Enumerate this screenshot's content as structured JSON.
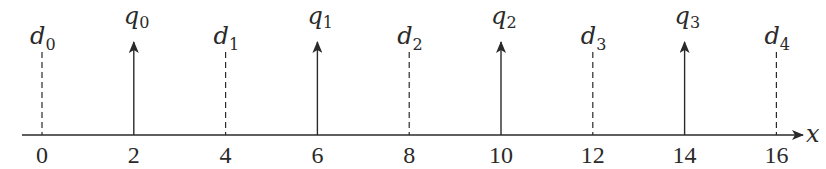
{
  "diagram": {
    "axis": {
      "label": "x",
      "min": 0,
      "max": 16
    },
    "ticks": [
      {
        "value": 0,
        "label": "0"
      },
      {
        "value": 2,
        "label": "2"
      },
      {
        "value": 4,
        "label": "4"
      },
      {
        "value": 6,
        "label": "6"
      },
      {
        "value": 8,
        "label": "8"
      },
      {
        "value": 10,
        "label": "10"
      },
      {
        "value": 12,
        "label": "12"
      },
      {
        "value": 14,
        "label": "14"
      },
      {
        "value": 16,
        "label": "16"
      }
    ],
    "decision_levels": [
      {
        "symbol": "d",
        "index": "0",
        "x": 0
      },
      {
        "symbol": "d",
        "index": "1",
        "x": 4
      },
      {
        "symbol": "d",
        "index": "2",
        "x": 8
      },
      {
        "symbol": "d",
        "index": "3",
        "x": 12
      },
      {
        "symbol": "d",
        "index": "4",
        "x": 16
      }
    ],
    "reconstruction_levels": [
      {
        "symbol": "q",
        "index": "0",
        "x": 2
      },
      {
        "symbol": "q",
        "index": "1",
        "x": 6
      },
      {
        "symbol": "q",
        "index": "2",
        "x": 10
      },
      {
        "symbol": "q",
        "index": "3",
        "x": 14
      }
    ],
    "colors": {
      "line": "#2a2a2a",
      "background": "#ffffff"
    }
  }
}
